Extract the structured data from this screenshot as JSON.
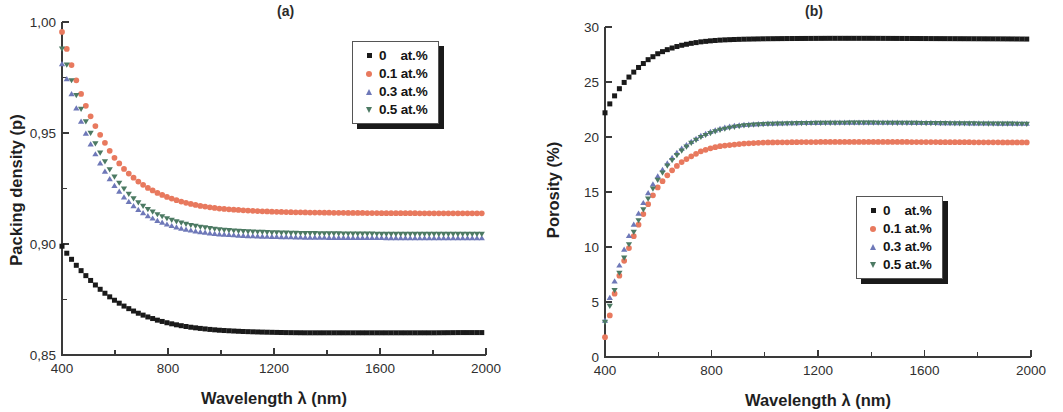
{
  "figure": {
    "panels": [
      {
        "panel_label": "(a)",
        "legend_position": "top-right"
      },
      {
        "panel_label": "(b)",
        "legend_position": "mid-right"
      }
    ]
  },
  "colors": {
    "series_0": "#1a1a1a",
    "series_01": "#e8795e",
    "series_03": "#6e78b8",
    "series_05": "#4c7a63",
    "axis": "#3a3a3a",
    "text": "#1f1f1f",
    "background": "#ffffff"
  },
  "legend": {
    "entries": [
      {
        "label": "0    at.%",
        "marker": "square",
        "color": "#1a1a1a"
      },
      {
        "label": "0.1 at.%",
        "marker": "circle",
        "color": "#e8795e"
      },
      {
        "label": "0.3 at.%",
        "marker": "triangle-up",
        "color": "#6e78b8"
      },
      {
        "label": "0.5 at.%",
        "marker": "triangle-down",
        "color": "#4c7a63"
      }
    ]
  },
  "chart_data": [
    {
      "type": "scatter",
      "title": "(a)",
      "xlabel": "Wavelength λ (nm)",
      "ylabel": "Packing density (p)",
      "xlim": [
        400,
        2000
      ],
      "ylim": [
        0.85,
        1.0
      ],
      "xticks": [
        400,
        800,
        1200,
        1600,
        2000
      ],
      "yticks": [
        "0,85",
        "0,90",
        "0,95",
        "1,00"
      ],
      "ytick_values": [
        0.85,
        0.9,
        0.95,
        1.0
      ],
      "minor_ticks": true,
      "grid": false,
      "legend_position": "upper right",
      "x": [
        400,
        420,
        440,
        460,
        480,
        500,
        520,
        540,
        560,
        580,
        600,
        640,
        680,
        720,
        760,
        800,
        840,
        880,
        920,
        960,
        1000,
        1080,
        1160,
        1240,
        1320,
        1400,
        1500,
        1600,
        1700,
        1800,
        1900,
        2000
      ],
      "series": [
        {
          "name": "0    at.%",
          "marker": "square",
          "color": "#1a1a1a",
          "values": [
            0.899,
            0.8955,
            0.8925,
            0.8895,
            0.887,
            0.8845,
            0.8822,
            0.88,
            0.878,
            0.8762,
            0.8745,
            0.8716,
            0.8692,
            0.8673,
            0.8657,
            0.8644,
            0.8634,
            0.8626,
            0.862,
            0.8615,
            0.8611,
            0.8606,
            0.8603,
            0.8601,
            0.86,
            0.86,
            0.86,
            0.86,
            0.86,
            0.86,
            0.8601,
            0.8601
          ]
        },
        {
          "name": "0.1 at.%",
          "marker": "circle",
          "color": "#e8795e",
          "values": [
            0.9955,
            0.987,
            0.979,
            0.9715,
            0.965,
            0.9595,
            0.9545,
            0.95,
            0.946,
            0.942,
            0.9385,
            0.933,
            0.9288,
            0.9255,
            0.923,
            0.921,
            0.9194,
            0.9182,
            0.9172,
            0.9165,
            0.9159,
            0.9152,
            0.9147,
            0.9144,
            0.9142,
            0.9141,
            0.914,
            0.9139,
            0.9139,
            0.9138,
            0.9138,
            0.9138
          ]
        },
        {
          "name": "0.3 at.%",
          "marker": "triangle-up",
          "color": "#6e78b8",
          "values": [
            0.981,
            0.9735,
            0.966,
            0.959,
            0.9525,
            0.947,
            0.9418,
            0.9372,
            0.933,
            0.9292,
            0.9258,
            0.9202,
            0.916,
            0.9128,
            0.9104,
            0.9086,
            0.9072,
            0.9062,
            0.9054,
            0.9048,
            0.9043,
            0.9037,
            0.9033,
            0.9031,
            0.9029,
            0.9028,
            0.9027,
            0.9027,
            0.9026,
            0.9026,
            0.9026,
            0.9026
          ]
        },
        {
          "name": "0.5 at.%",
          "marker": "triangle-down",
          "color": "#4c7a63",
          "values": [
            0.988,
            0.98,
            0.9722,
            0.9648,
            0.9582,
            0.9522,
            0.9468,
            0.942,
            0.9376,
            0.9336,
            0.93,
            0.924,
            0.9194,
            0.916,
            0.9134,
            0.9114,
            0.9099,
            0.9087,
            0.9078,
            0.9071,
            0.9065,
            0.9058,
            0.9054,
            0.9051,
            0.9049,
            0.9048,
            0.9047,
            0.9046,
            0.9046,
            0.9046,
            0.9046,
            0.9046
          ]
        }
      ]
    },
    {
      "type": "scatter",
      "title": "(b)",
      "xlabel": "Wavelength λ (nm)",
      "ylabel": "Porosity (%)",
      "xlim": [
        400,
        2000
      ],
      "ylim": [
        0,
        30
      ],
      "xticks": [
        400,
        800,
        1200,
        1600,
        2000
      ],
      "yticks": [
        0,
        5,
        10,
        15,
        20,
        25,
        30
      ],
      "minor_ticks": false,
      "grid": false,
      "legend_position": "center right",
      "x": [
        400,
        420,
        440,
        460,
        480,
        500,
        520,
        540,
        560,
        580,
        600,
        640,
        680,
        720,
        760,
        800,
        840,
        880,
        920,
        960,
        1000,
        1080,
        1160,
        1240,
        1320,
        1400,
        1500,
        1600,
        1700,
        1800,
        1900,
        2000
      ],
      "series": [
        {
          "name": "0    at.%",
          "marker": "square",
          "color": "#1a1a1a",
          "values": [
            22.2,
            23.1,
            23.9,
            24.6,
            25.2,
            25.7,
            26.2,
            26.6,
            27.0,
            27.3,
            27.6,
            28.0,
            28.3,
            28.5,
            28.65,
            28.75,
            28.82,
            28.86,
            28.89,
            28.91,
            28.93,
            28.95,
            28.96,
            28.97,
            28.97,
            28.97,
            28.96,
            28.95,
            28.94,
            28.93,
            28.92,
            28.9
          ]
        },
        {
          "name": "0.1 at.%",
          "marker": "circle",
          "color": "#e8795e",
          "values": [
            1.8,
            4.0,
            6.2,
            7.9,
            9.3,
            10.5,
            11.7,
            12.8,
            13.8,
            14.7,
            15.5,
            16.7,
            17.6,
            18.2,
            18.7,
            19.0,
            19.2,
            19.3,
            19.4,
            19.45,
            19.5,
            19.52,
            19.54,
            19.55,
            19.55,
            19.55,
            19.55,
            19.54,
            19.53,
            19.52,
            19.51,
            19.5
          ]
        },
        {
          "name": "0.3 at.%",
          "marker": "triangle-up",
          "color": "#6e78b8",
          "values": [
            3.3,
            5.6,
            7.2,
            8.8,
            10.4,
            11.6,
            12.7,
            13.8,
            14.8,
            15.7,
            16.5,
            17.8,
            18.8,
            19.5,
            20.1,
            20.5,
            20.8,
            21.0,
            21.1,
            21.15,
            21.2,
            21.25,
            21.28,
            21.3,
            21.3,
            21.3,
            21.3,
            21.28,
            21.26,
            21.24,
            21.22,
            21.2
          ]
        },
        {
          "name": "0.5 at.%",
          "marker": "triangle-down",
          "color": "#4c7a63",
          "values": [
            3.2,
            4.8,
            6.4,
            8.2,
            9.6,
            10.9,
            12.1,
            13.2,
            14.3,
            15.3,
            16.2,
            17.6,
            18.6,
            19.4,
            20.0,
            20.4,
            20.7,
            20.9,
            21.05,
            21.12,
            21.18,
            21.24,
            21.27,
            21.29,
            21.3,
            21.3,
            21.29,
            21.27,
            21.25,
            21.23,
            21.21,
            21.2
          ]
        }
      ]
    }
  ]
}
